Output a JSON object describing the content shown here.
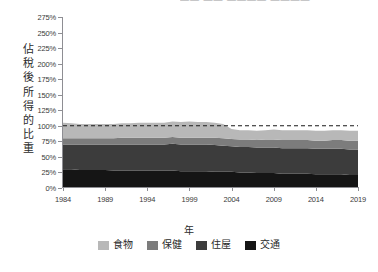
{
  "top_clipped_text": "—— —— ———— ————",
  "axis": {
    "y_title_chars": [
      "佔",
      "稅",
      "後",
      "所",
      "得",
      "的",
      "比",
      "重"
    ],
    "x_title": "年"
  },
  "legend": {
    "items": [
      {
        "label": "食物",
        "color": "#b8b8b8"
      },
      {
        "label": "保健",
        "color": "#7c7c7c"
      },
      {
        "label": "住屋",
        "color": "#3c3c3c"
      },
      {
        "label": "交通",
        "color": "#151515"
      }
    ]
  },
  "chart_data": {
    "type": "area",
    "stacked": true,
    "title": "",
    "xlabel": "年",
    "ylabel": "佔稅後所得的比重",
    "xlim": [
      1984,
      2019
    ],
    "ylim": [
      0,
      275
    ],
    "ytick_labels": [
      "0%",
      "25%",
      "50%",
      "75%",
      "100%",
      "125%",
      "150%",
      "175%",
      "200%",
      "225%",
      "250%",
      "275%"
    ],
    "ytick_values": [
      0,
      25,
      50,
      75,
      100,
      125,
      150,
      175,
      200,
      225,
      250,
      275
    ],
    "xtick_labels": [
      "1984",
      "1989",
      "1994",
      "1999",
      "2004",
      "2009",
      "2014",
      "2019"
    ],
    "xtick_values": [
      1984,
      1989,
      1994,
      1999,
      2004,
      2009,
      2014,
      2019
    ],
    "grid": false,
    "legend_position": "bottom",
    "reference_line": {
      "value": 100,
      "style": "dashed",
      "color": "#1a1a1a"
    },
    "x": [
      1984,
      1985,
      1986,
      1987,
      1988,
      1989,
      1990,
      1991,
      1992,
      1993,
      1994,
      1995,
      1996,
      1997,
      1998,
      1999,
      2000,
      2001,
      2002,
      2003,
      2004,
      2005,
      2006,
      2007,
      2008,
      2009,
      2010,
      2011,
      2012,
      2013,
      2014,
      2015,
      2016,
      2017,
      2018,
      2019
    ],
    "series": [
      {
        "name": "交通",
        "color": "#151515",
        "values": [
          30,
          30,
          29,
          29,
          29,
          29,
          28,
          28,
          28,
          28,
          28,
          28,
          28,
          28,
          27,
          27,
          27,
          27,
          26,
          26,
          26,
          25,
          25,
          24,
          24,
          24,
          23,
          23,
          23,
          23,
          22,
          22,
          22,
          22,
          21,
          21
        ]
      },
      {
        "name": "住屋",
        "color": "#3c3c3c",
        "values": [
          40,
          40,
          41,
          41,
          41,
          41,
          42,
          42,
          42,
          42,
          42,
          42,
          42,
          43,
          43,
          43,
          43,
          43,
          43,
          42,
          41,
          41,
          41,
          41,
          41,
          41,
          41,
          41,
          41,
          41,
          41,
          41,
          41,
          41,
          41,
          41
        ]
      },
      {
        "name": "保健",
        "color": "#7c7c7c",
        "values": [
          10,
          10,
          10,
          10,
          10,
          10,
          10,
          11,
          11,
          11,
          11,
          11,
          11,
          11,
          11,
          11,
          11,
          11,
          12,
          12,
          12,
          12,
          12,
          12,
          13,
          13,
          13,
          13,
          13,
          13,
          13,
          13,
          14,
          14,
          14,
          14
        ]
      },
      {
        "name": "食物",
        "color": "#b8b8b8",
        "values": [
          25,
          24,
          23,
          23,
          23,
          23,
          23,
          23,
          23,
          24,
          24,
          24,
          24,
          25,
          25,
          26,
          25,
          25,
          24,
          23,
          16,
          15,
          15,
          15,
          15,
          16,
          16,
          16,
          16,
          16,
          16,
          16,
          16,
          16,
          16,
          16
        ]
      }
    ],
    "totals": [
      105,
      104,
      103,
      103,
      103,
      103,
      103,
      104,
      104,
      105,
      105,
      105,
      105,
      107,
      106,
      107,
      106,
      106,
      105,
      103,
      95,
      93,
      93,
      92,
      93,
      94,
      93,
      93,
      93,
      93,
      92,
      92,
      93,
      93,
      92,
      92
    ]
  }
}
